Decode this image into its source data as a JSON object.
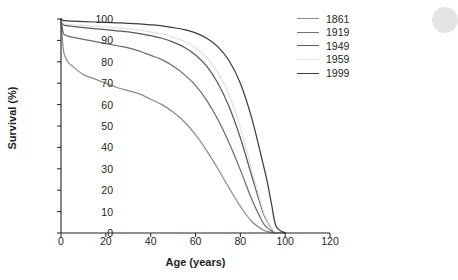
{
  "chart_data": {
    "type": "line",
    "title": "",
    "xlabel": "Age (years)",
    "ylabel": "Survival (%)",
    "xlim": [
      0,
      120
    ],
    "ylim": [
      0,
      100
    ],
    "xticks": [
      0,
      20,
      40,
      60,
      80,
      100,
      120
    ],
    "yticks": [
      0,
      10,
      20,
      30,
      40,
      50,
      60,
      70,
      80,
      90,
      100
    ],
    "grid": false,
    "legend_position": "top-right",
    "x": [
      0,
      1,
      2,
      3,
      5,
      10,
      15,
      20,
      25,
      30,
      35,
      40,
      45,
      50,
      55,
      60,
      65,
      70,
      75,
      80,
      85,
      90,
      92,
      94,
      96,
      100
    ],
    "series": [
      {
        "name": "1861",
        "color": "#8c8c8c",
        "values": [
          100,
          86,
          82,
          80,
          78,
          74,
          72,
          70,
          68,
          66.5,
          65,
          62.5,
          60,
          56.5,
          52,
          46,
          38.5,
          30,
          21,
          12.5,
          5.5,
          1.5,
          0.8,
          0.3,
          0,
          0
        ]
      },
      {
        "name": "1919",
        "color": "#6e6e6e",
        "values": [
          100,
          93.5,
          92.5,
          92,
          91.5,
          90.5,
          89.5,
          88.5,
          87.5,
          86.5,
          85,
          83,
          81,
          78,
          74,
          69,
          62,
          53,
          42,
          29.5,
          16,
          5,
          2.5,
          1,
          0,
          0
        ]
      },
      {
        "name": "1949",
        "color": "#595959",
        "values": [
          100,
          97.5,
          97,
          96.8,
          96.5,
          96,
          95.5,
          95,
          94.5,
          94,
          93.2,
          92.2,
          91,
          89.2,
          86.8,
          83.2,
          78,
          70,
          59,
          44.5,
          27,
          10,
          5.5,
          2,
          0,
          0
        ]
      },
      {
        "name": "1959",
        "color": "#e2e2e2",
        "values": [
          100,
          98,
          97.7,
          97.5,
          97.3,
          97,
          96.7,
          96.3,
          95.9,
          95.4,
          94.8,
          94,
          93,
          91.5,
          89.5,
          86.5,
          82,
          75,
          64.5,
          49.5,
          30,
          11,
          6,
          2.2,
          0,
          0
        ]
      },
      {
        "name": "1999",
        "color": "#3c3c3c",
        "values": [
          100,
          99.3,
          99.2,
          99.1,
          99,
          98.8,
          98.6,
          98.4,
          98.2,
          98,
          97.7,
          97.3,
          96.8,
          96,
          95,
          93.5,
          91,
          87,
          80.5,
          70,
          54,
          33,
          24,
          13,
          3,
          0
        ]
      }
    ]
  },
  "legend": {
    "entries": [
      {
        "label": "1861"
      },
      {
        "label": "1919"
      },
      {
        "label": "1949"
      },
      {
        "label": "1959"
      },
      {
        "label": "1999"
      }
    ]
  }
}
